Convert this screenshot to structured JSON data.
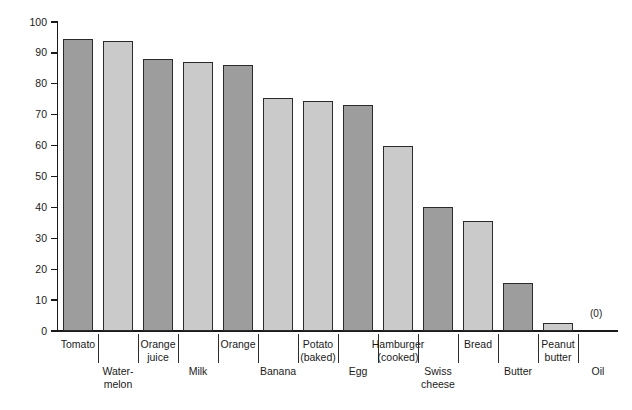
{
  "chart_data": {
    "type": "bar",
    "title": "",
    "xlabel": "",
    "ylabel": "% Water",
    "ylim": [
      0,
      100
    ],
    "yticks": [
      0,
      10,
      20,
      30,
      40,
      50,
      60,
      70,
      80,
      90,
      100
    ],
    "grid": false,
    "legend": "none",
    "categories": [
      "Tomato",
      "Water-\nmelon",
      "Orange\njuice",
      "Milk",
      "Orange",
      "Banana",
      "Potato\n(baked)",
      "Egg",
      "Hamburger\n(cooked)",
      "Swiss\ncheese",
      "Bread",
      "Butter",
      "Peanut\nbutter",
      "Oil"
    ],
    "values": [
      94.5,
      94,
      88,
      87,
      86,
      75.5,
      74.5,
      73,
      60,
      40,
      35.5,
      15.5,
      2.5,
      0
    ],
    "annotations": [
      {
        "text": "(0)",
        "category": "Oil",
        "value": 0
      }
    ],
    "bar_shades": [
      "dark",
      "light",
      "dark",
      "light",
      "dark",
      "light",
      "light",
      "dark",
      "light",
      "dark",
      "light",
      "dark",
      "light",
      "dark"
    ],
    "label_rows": [
      "top",
      "bottom",
      "top",
      "bottom",
      "top",
      "bottom",
      "top",
      "bottom",
      "top",
      "bottom",
      "top",
      "bottom",
      "top",
      "bottom"
    ]
  },
  "colors": {
    "bar_dark": "#9d9d9d",
    "bar_light": "#cacaca",
    "bar_outline": "#2b2b2b",
    "axis": "#1a1a1a",
    "background": "#ffffff",
    "text": "#1a1a1a"
  }
}
